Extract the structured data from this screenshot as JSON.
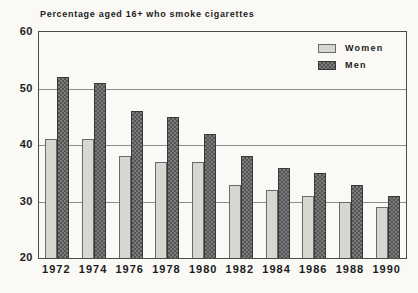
{
  "title": "Percentage aged 16+ who smoke cigarettes",
  "legend": {
    "women_label": "Women",
    "men_label": "Men"
  },
  "colors": {
    "background": "#faf9f6",
    "text": "#1c1c1c",
    "frame": "#4a4a4a",
    "grid": "#8f8d89",
    "women_fill": "#d8d6d1",
    "women_dot": "#aba8a2",
    "women_border": "#6a6a6a",
    "men_fill": "#7b7b7b",
    "men_check": "#545454",
    "men_border": "#383838"
  },
  "chart_data": {
    "type": "bar",
    "title": "Percentage aged 16+ who smoke cigarettes",
    "categories": [
      "1972",
      "1974",
      "1976",
      "1978",
      "1980",
      "1982",
      "1984",
      "1986",
      "1988",
      "1990"
    ],
    "series": [
      {
        "name": "Women",
        "values": [
          41,
          41,
          38,
          37,
          37,
          33,
          32,
          31,
          30,
          29
        ]
      },
      {
        "name": "Men",
        "values": [
          52,
          51,
          46,
          45,
          42,
          38,
          36,
          35,
          33,
          31
        ]
      }
    ],
    "xlabel": "",
    "ylabel": "",
    "ylim": [
      20,
      60
    ],
    "yticks": [
      20,
      30,
      40,
      50,
      60
    ],
    "grid": true,
    "legend_position": "top-right"
  }
}
